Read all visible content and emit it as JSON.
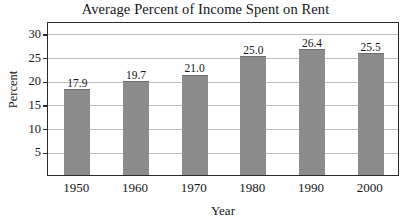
{
  "chart_data": {
    "type": "bar",
    "title": "Average Percent of Income Spent on Rent",
    "xlabel": "Year",
    "ylabel": "Percent",
    "categories": [
      "1950",
      "1960",
      "1970",
      "1980",
      "1990",
      "2000"
    ],
    "values": [
      17.9,
      19.7,
      21.0,
      25.0,
      26.4,
      25.5
    ],
    "value_labels": [
      "17.9",
      "19.7",
      "21.0",
      "25.0",
      "26.4",
      "25.5"
    ],
    "ylim": [
      0,
      32.5
    ],
    "yticks": [
      5,
      10,
      15,
      20,
      25,
      30
    ],
    "ytick_labels": [
      "5",
      "10",
      "15",
      "20",
      "25",
      "30"
    ],
    "grid": true,
    "legend": false,
    "bar_color": "#8c8c8c",
    "frame_color": "#2b2b2b",
    "grid_color": "#bdbdbd",
    "background": "#ffffff"
  }
}
